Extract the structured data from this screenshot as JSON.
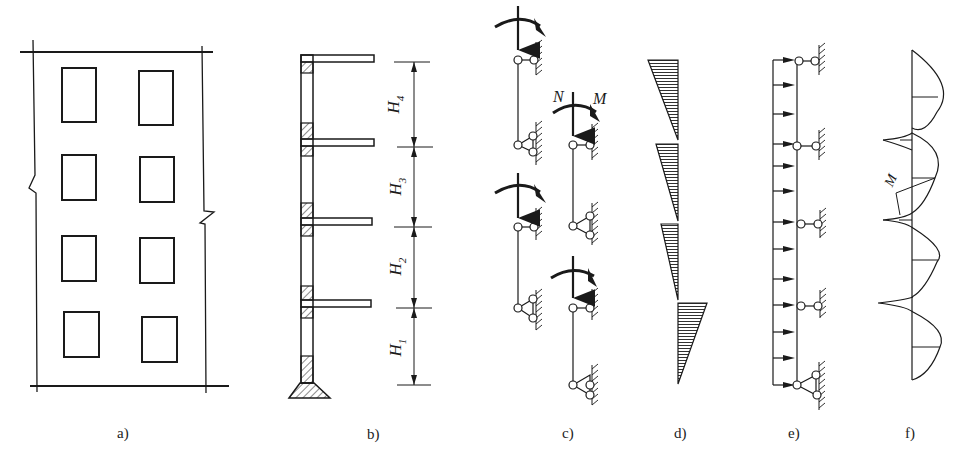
{
  "figure": {
    "panels": [
      {
        "id": "a",
        "caption": "a)",
        "description": "Building elevation with 4 floors, 2 window columns, break lines on walls"
      },
      {
        "id": "b",
        "caption": "b)",
        "description": "Wall section with floor slabs and story heights",
        "dimension_labels": [
          "H4",
          "H3",
          "H2",
          "H1"
        ],
        "dimension_labels_display": [
          {
            "base": "H",
            "sub": "4"
          },
          {
            "base": "H",
            "sub": "3"
          },
          {
            "base": "H",
            "sub": "2"
          },
          {
            "base": "H",
            "sub": "1"
          }
        ]
      },
      {
        "id": "c",
        "caption": "c)",
        "description": "Each story as simply supported member with axial force N and moment M",
        "force_labels": {
          "axial": "N",
          "moment": "M"
        }
      },
      {
        "id": "d",
        "caption": "d)",
        "description": "Bending moment diagram per story (triangular, hatched)"
      },
      {
        "id": "e",
        "caption": "e)",
        "description": "Continuous member under uniform lateral load with pin supports at each floor"
      },
      {
        "id": "f",
        "caption": "f)",
        "description": "Bending moment diagram of continuous member",
        "moment_label": "M"
      }
    ]
  },
  "colors": {
    "line": "#1a1a1a",
    "background": "#ffffff"
  }
}
